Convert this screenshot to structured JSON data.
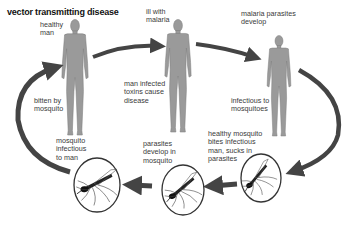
{
  "title": "vector transmitting disease",
  "colors": {
    "figure": "#9a9a9a",
    "figure_outline": "#7a7a7a",
    "arrow": "#444444",
    "circle": "#333333",
    "text": "#3a3a3a",
    "title": "#111111"
  },
  "stages": [
    {
      "id": "healthy-man",
      "kind": "human",
      "label": "healthy\nman"
    },
    {
      "id": "ill-with-malaria",
      "kind": "human",
      "label": "ill with\nmalaria"
    },
    {
      "id": "malaria-parasites-develop",
      "kind": "human",
      "label": "malaria parasites\ndevelop"
    },
    {
      "id": "mosquito-sucks-parasites",
      "kind": "mosquito",
      "label": "healthy mosquito\nbites infectious\nman, sucks in\nparasites"
    },
    {
      "id": "parasites-develop-in-mosquito",
      "kind": "mosquito",
      "label": "parasites\ndevelop in\nmosquito"
    },
    {
      "id": "mosquito-infectious",
      "kind": "mosquito",
      "label": "mosquito\ninfectious\nto man"
    }
  ],
  "annotations": {
    "toxins": "man infected\ntoxins cause\ndisease",
    "infectious_to_mosquitoes": "infectious to\nmosquitoes",
    "bitten": "bitten by\nmosquito"
  },
  "arrows": [
    {
      "from": "healthy-man",
      "to": "ill-with-malaria"
    },
    {
      "from": "ill-with-malaria",
      "to": "malaria-parasites-develop"
    },
    {
      "from": "malaria-parasites-develop",
      "to": "mosquito-sucks-parasites"
    },
    {
      "from": "mosquito-sucks-parasites",
      "to": "parasites-develop-in-mosquito"
    },
    {
      "from": "parasites-develop-in-mosquito",
      "to": "mosquito-infectious"
    },
    {
      "from": "mosquito-infectious",
      "to": "healthy-man"
    }
  ]
}
